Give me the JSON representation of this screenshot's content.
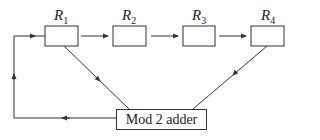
{
  "diagram": {
    "type": "shift register with feedback",
    "registers": [
      {
        "name": "R",
        "sub": "1"
      },
      {
        "name": "R",
        "sub": "2"
      },
      {
        "name": "R",
        "sub": "3"
      },
      {
        "name": "R",
        "sub": "4"
      }
    ],
    "adder_label": "Mod 2 adder",
    "colors": {
      "stroke": "#333333",
      "text": "#222222",
      "background": "#ffffff"
    }
  }
}
